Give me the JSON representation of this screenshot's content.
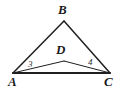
{
  "figure": {
    "kind": "geometry-diagram",
    "background_color": "#ffffff",
    "stroke_color": "#1f1f1f",
    "outer_stroke_width": 1.5,
    "inner_stroke_width": 1.0,
    "base_stroke_width": 2.0
  },
  "points": {
    "A": {
      "label": "A",
      "x": 13,
      "y": 73
    },
    "B": {
      "label": "B",
      "x": 64,
      "y": 21
    },
    "C": {
      "label": "C",
      "x": 110,
      "y": 73
    },
    "D": {
      "label": "D",
      "x": 64,
      "y": 61
    }
  },
  "segments": [
    {
      "name": "AB",
      "from": "A",
      "to": "B",
      "role": "outer-triangle-side"
    },
    {
      "name": "BC",
      "from": "B",
      "to": "C",
      "role": "outer-triangle-side"
    },
    {
      "name": "AC",
      "from": "A",
      "to": "C",
      "role": "shared-base"
    },
    {
      "name": "AD",
      "from": "A",
      "to": "D",
      "role": "inner-triangle-side"
    },
    {
      "name": "DC",
      "from": "D",
      "to": "C",
      "role": "inner-triangle-side"
    }
  ],
  "angle_labels": [
    {
      "name": "angle-3",
      "label": "3",
      "at_vertex": "A",
      "between": "AD and AC"
    },
    {
      "name": "angle-4",
      "label": "4",
      "at_vertex": "C",
      "between": "CD and CA"
    }
  ]
}
